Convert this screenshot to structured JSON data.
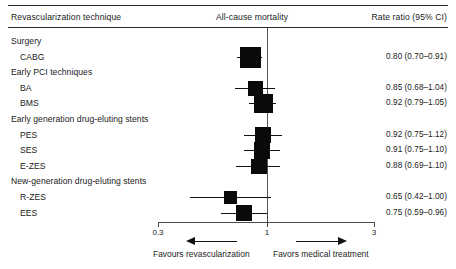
{
  "header": {
    "left": "Revascularization technique",
    "middle": "All-cause mortality",
    "right": "Rate ratio (95% CI)"
  },
  "axis": {
    "ticks": [
      "0.3",
      "1",
      "3"
    ],
    "tick_values": [
      0.3,
      1,
      3
    ],
    "null_value": 1
  },
  "footer": {
    "left_caption": "Favours revascularization",
    "right_caption": "Favors medical treatment",
    "left_arrow": "left-arrow-icon",
    "right_arrow": "right-arrow-icon"
  },
  "colors": {
    "marker": "#0a0a0a",
    "line": "#111111",
    "rule": "#2b2b2b",
    "null_line": "#555555",
    "text": "#1a1a1a",
    "background": "#ffffff"
  },
  "chart_data": {
    "type": "forest",
    "title": "All-cause mortality",
    "xlabel": "Rate ratio (95% CI)",
    "ylabel": "Revascularization technique",
    "xscale": "log",
    "xlim": [
      0.3,
      3
    ],
    "xticks": [
      0.3,
      1,
      3
    ],
    "null_line": 1,
    "grid": false,
    "legend": "none",
    "rows": [
      {
        "kind": "group",
        "label": "Surgery"
      },
      {
        "kind": "study",
        "label": "CABG",
        "estimate": 0.8,
        "ci_low": 0.7,
        "ci_high": 0.91,
        "rr_text": "0.80 (0.70–0.91)",
        "weight": 1.0
      },
      {
        "kind": "group",
        "label": "Early PCI techniques"
      },
      {
        "kind": "study",
        "label": "BA",
        "estimate": 0.85,
        "ci_low": 0.68,
        "ci_high": 1.04,
        "rr_text": "0.85 (0.68–1.04)",
        "weight": 0.55
      },
      {
        "kind": "study",
        "label": "BMS",
        "estimate": 0.92,
        "ci_low": 0.79,
        "ci_high": 1.05,
        "rr_text": "0.92 (0.79–1.05)",
        "weight": 0.82
      },
      {
        "kind": "group",
        "label": "Early generation drug-eluting stents"
      },
      {
        "kind": "study",
        "label": "PES",
        "estimate": 0.92,
        "ci_low": 0.75,
        "ci_high": 1.12,
        "rr_text": "0.92 (0.75–1.12)",
        "weight": 0.64
      },
      {
        "kind": "study",
        "label": "SES",
        "estimate": 0.91,
        "ci_low": 0.75,
        "ci_high": 1.1,
        "rr_text": "0.91 (0.75–1.10)",
        "weight": 0.64
      },
      {
        "kind": "study",
        "label": "E-ZES",
        "estimate": 0.88,
        "ci_low": 0.69,
        "ci_high": 1.1,
        "rr_text": "0.88 (0.69–1.10)",
        "weight": 0.55
      },
      {
        "kind": "group",
        "label": "New-generation drug-eluting stents"
      },
      {
        "kind": "study",
        "label": "R-ZES",
        "estimate": 0.65,
        "ci_low": 0.42,
        "ci_high": 1.0,
        "rr_text": "0.65 (0.42–1.00)",
        "weight": 0.33
      },
      {
        "kind": "study",
        "label": "EES",
        "estimate": 0.75,
        "ci_low": 0.59,
        "ci_high": 0.96,
        "rr_text": "0.75 (0.59–0.96)",
        "weight": 0.55
      }
    ]
  }
}
